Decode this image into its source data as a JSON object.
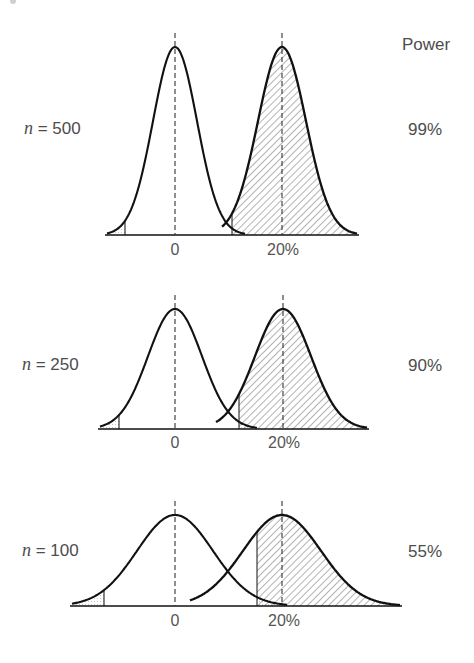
{
  "header": {
    "power_label": "Power"
  },
  "colors": {
    "curve": "#111111",
    "dash": "#333333",
    "hatch": "#555555",
    "text": "#4d4d4d"
  },
  "panels": [
    {
      "n_label_var": "n",
      "n_label_rest": " = 500",
      "power": "99%",
      "tick_null": "0",
      "tick_alt": "20%"
    },
    {
      "n_label_var": "n",
      "n_label_rest": " = 250",
      "power": "90%",
      "tick_null": "0",
      "tick_alt": "20%"
    },
    {
      "n_label_var": "n",
      "n_label_rest": " = 100",
      "power": "55%",
      "tick_null": "0",
      "tick_alt": "20%"
    }
  ],
  "chart_data": {
    "type": "area",
    "title": "",
    "xlabel": "",
    "ylabel": "",
    "legend": {
      "title": "Power",
      "position": "right"
    },
    "grid": false,
    "x_ticks": [
      "0",
      "20%"
    ],
    "series": [
      {
        "name": "n = 500",
        "n": 500,
        "power_pct": 99,
        "null_mean": 0,
        "alt_mean": 20,
        "geometry": {
          "baseline": 235,
          "peak": 47,
          "x_null": 175,
          "x_alt": 282,
          "sigma_null": 22,
          "sigma_alt": 24,
          "x_min": 107,
          "x_max": 357,
          "crit_left": 125,
          "crit_right": 232,
          "null_end": 245,
          "alt_start": 222,
          "tick_y": 250
        }
      },
      {
        "name": "n = 250",
        "n": 250,
        "power_pct": 90,
        "null_mean": 0,
        "alt_mean": 20,
        "geometry": {
          "baseline": 429,
          "peak": 309,
          "x_null": 175,
          "x_alt": 283,
          "sigma_null": 27,
          "sigma_alt": 28,
          "x_min": 100,
          "x_max": 367,
          "crit_left": 119,
          "crit_right": 239,
          "null_end": 257,
          "alt_start": 216,
          "tick_y": 443
        }
      },
      {
        "name": "n = 100",
        "n": 100,
        "power_pct": 55,
        "null_mean": 0,
        "alt_mean": 20,
        "geometry": {
          "baseline": 606,
          "peak": 515,
          "x_null": 175,
          "x_alt": 282,
          "sigma_null": 38,
          "sigma_alt": 39,
          "x_min": 72,
          "x_max": 400,
          "crit_left": 104,
          "crit_right": 257,
          "null_end": 287,
          "alt_start": 190,
          "tick_y": 621
        }
      }
    ]
  }
}
